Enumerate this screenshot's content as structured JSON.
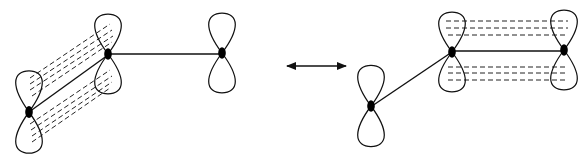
{
  "diagram": {
    "type": "resonance-orbital-diagram",
    "colors": {
      "stroke": "#111111",
      "background": "#ffffff"
    },
    "left_structure": {
      "atoms": [
        {
          "id": "A",
          "x": 29,
          "y": 112
        },
        {
          "id": "B",
          "x": 108,
          "y": 52
        },
        {
          "id": "C",
          "x": 222,
          "y": 52
        }
      ],
      "sigma_bonds": [
        [
          "A",
          "B"
        ],
        [
          "B",
          "C"
        ]
      ],
      "pi_overlap": [
        "A",
        "B"
      ]
    },
    "resonance_arrow": {
      "x1": 285,
      "x2": 348,
      "y": 66,
      "style": "double-headed"
    },
    "right_structure": {
      "atoms": [
        {
          "id": "D",
          "x": 371,
          "y": 106
        },
        {
          "id": "E",
          "x": 452,
          "y": 51
        },
        {
          "id": "F",
          "x": 563,
          "y": 49
        }
      ],
      "sigma_bonds": [
        [
          "D",
          "E"
        ],
        [
          "E",
          "F"
        ]
      ],
      "pi_overlap": [
        "E",
        "F"
      ]
    }
  }
}
